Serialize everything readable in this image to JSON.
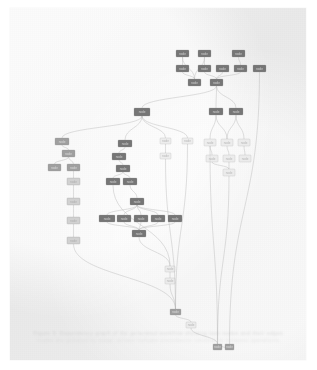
{
  "document": {
    "page_background": "#eeeeee",
    "canvas_background": "#ffffff",
    "caption_primary": "Figure 9: Dependency graph of the generated workflow showing task nodes and their edges.",
    "caption_secondary": "nodes are grouped by stage; arrows indicate precedence constraints between operations."
  },
  "figure": {
    "node_fill_dark": "#6f6f6f",
    "node_fill_mid": "#9a9a9a",
    "node_fill_light": "#cfcfcf",
    "node_fill_faint": "#e2e2e2",
    "node_stroke": "#8a8a8a",
    "edge_color": "#b5b5b5",
    "label_color": "#3a3a3a"
  },
  "chart_data": {
    "type": "diagram",
    "diagram_kind": "directed-acyclic-graph",
    "node_count": 61,
    "edge_count": 74,
    "clusters": [
      {
        "name": "top-right-source-cluster",
        "node_ids": [
          "n1",
          "n2",
          "n3",
          "n4",
          "n5",
          "n6",
          "n7",
          "n8",
          "n9"
        ]
      },
      {
        "name": "left-chain-cluster",
        "node_ids": [
          "n20",
          "n21",
          "n22",
          "n23",
          "n24",
          "n25",
          "n26",
          "n27"
        ]
      },
      {
        "name": "center-stack-cluster",
        "node_ids": [
          "n30",
          "n31",
          "n32",
          "n33",
          "n34"
        ]
      },
      {
        "name": "center-fan-cluster",
        "node_ids": [
          "n35",
          "n36",
          "n37",
          "n38",
          "n39",
          "n40",
          "n41"
        ]
      },
      {
        "name": "right-grid-cluster",
        "node_ids": [
          "n10",
          "n11",
          "n12",
          "n13",
          "n14",
          "n15",
          "n16",
          "n17",
          "n18",
          "n19"
        ]
      },
      {
        "name": "bottom-sink-cluster",
        "node_ids": [
          "n50",
          "n51",
          "n52",
          "n53",
          "n54",
          "n55"
        ]
      }
    ],
    "nodes": [
      {
        "id": "n1",
        "x": 166,
        "y": 42,
        "w": 13,
        "h": 7,
        "shade": "dark",
        "label": "node"
      },
      {
        "id": "n2",
        "x": 188,
        "y": 42,
        "w": 13,
        "h": 7,
        "shade": "dark",
        "label": "node"
      },
      {
        "id": "n3",
        "x": 222,
        "y": 42,
        "w": 13,
        "h": 7,
        "shade": "dark",
        "label": "node"
      },
      {
        "id": "n4",
        "x": 166,
        "y": 57,
        "w": 13,
        "h": 7,
        "shade": "dark",
        "label": "node"
      },
      {
        "id": "n5",
        "x": 188,
        "y": 57,
        "w": 13,
        "h": 7,
        "shade": "dark",
        "label": "node"
      },
      {
        "id": "n6",
        "x": 206,
        "y": 57,
        "w": 13,
        "h": 7,
        "shade": "dark",
        "label": "node"
      },
      {
        "id": "n7",
        "x": 224,
        "y": 57,
        "w": 13,
        "h": 7,
        "shade": "dark",
        "label": "node"
      },
      {
        "id": "n8",
        "x": 243,
        "y": 57,
        "w": 13,
        "h": 7,
        "shade": "dark",
        "label": "node"
      },
      {
        "id": "n9",
        "x": 178,
        "y": 71,
        "w": 13,
        "h": 7,
        "shade": "dark",
        "label": "node"
      },
      {
        "id": "n10",
        "x": 200,
        "y": 71,
        "w": 13,
        "h": 7,
        "shade": "dark",
        "label": "node"
      },
      {
        "id": "n11",
        "x": 199,
        "y": 100,
        "w": 14,
        "h": 7,
        "shade": "dark",
        "label": "node"
      },
      {
        "id": "n12",
        "x": 219,
        "y": 100,
        "w": 14,
        "h": 7,
        "shade": "dark",
        "label": "node"
      },
      {
        "id": "n13",
        "x": 194,
        "y": 131,
        "w": 12,
        "h": 7,
        "shade": "faint",
        "label": "node"
      },
      {
        "id": "n14",
        "x": 211,
        "y": 131,
        "w": 12,
        "h": 7,
        "shade": "faint",
        "label": "node"
      },
      {
        "id": "n15",
        "x": 228,
        "y": 131,
        "w": 12,
        "h": 7,
        "shade": "faint",
        "label": "node"
      },
      {
        "id": "n16",
        "x": 196,
        "y": 147,
        "w": 12,
        "h": 7,
        "shade": "faint",
        "label": "node"
      },
      {
        "id": "n17",
        "x": 213,
        "y": 147,
        "w": 12,
        "h": 7,
        "shade": "faint",
        "label": "node"
      },
      {
        "id": "n18",
        "x": 229,
        "y": 147,
        "w": 12,
        "h": 7,
        "shade": "faint",
        "label": "node"
      },
      {
        "id": "n19",
        "x": 213,
        "y": 161,
        "w": 12,
        "h": 7,
        "shade": "faint",
        "label": "node"
      },
      {
        "id": "n20",
        "x": 45,
        "y": 130,
        "w": 14,
        "h": 7,
        "shade": "mid",
        "label": "node"
      },
      {
        "id": "n21",
        "x": 52,
        "y": 142,
        "w": 13,
        "h": 7,
        "shade": "mid",
        "label": "node"
      },
      {
        "id": "n22",
        "x": 38,
        "y": 156,
        "w": 13,
        "h": 7,
        "shade": "mid",
        "label": "node"
      },
      {
        "id": "n23",
        "x": 57,
        "y": 156,
        "w": 13,
        "h": 7,
        "shade": "mid",
        "label": "node"
      },
      {
        "id": "n24",
        "x": 57,
        "y": 170,
        "w": 13,
        "h": 7,
        "shade": "light",
        "label": "node"
      },
      {
        "id": "n25",
        "x": 57,
        "y": 190,
        "w": 13,
        "h": 7,
        "shade": "light",
        "label": "node"
      },
      {
        "id": "n26",
        "x": 57,
        "y": 209,
        "w": 13,
        "h": 7,
        "shade": "light",
        "label": "node"
      },
      {
        "id": "n27",
        "x": 57,
        "y": 229,
        "w": 13,
        "h": 7,
        "shade": "light",
        "label": "node"
      },
      {
        "id": "n30",
        "x": 124,
        "y": 100,
        "w": 16,
        "h": 8,
        "shade": "dark",
        "label": "node"
      },
      {
        "id": "n31",
        "x": 108,
        "y": 132,
        "w": 14,
        "h": 7,
        "shade": "dark",
        "label": "node"
      },
      {
        "id": "n32",
        "x": 102,
        "y": 145,
        "w": 14,
        "h": 7,
        "shade": "dark",
        "label": "node"
      },
      {
        "id": "n33",
        "x": 106,
        "y": 157,
        "w": 14,
        "h": 7,
        "shade": "dark",
        "label": "node"
      },
      {
        "id": "n34",
        "x": 96,
        "y": 170,
        "w": 14,
        "h": 7,
        "shade": "dark",
        "label": "node"
      },
      {
        "id": "n35",
        "x": 113,
        "y": 170,
        "w": 14,
        "h": 7,
        "shade": "dark",
        "label": "node"
      },
      {
        "id": "n36",
        "x": 120,
        "y": 190,
        "w": 14,
        "h": 7,
        "shade": "dark",
        "label": "node"
      },
      {
        "id": "n37",
        "x": 89,
        "y": 207,
        "w": 16,
        "h": 7,
        "shade": "dark",
        "label": "node"
      },
      {
        "id": "n38",
        "x": 107,
        "y": 207,
        "w": 14,
        "h": 7,
        "shade": "dark",
        "label": "node"
      },
      {
        "id": "n39",
        "x": 124,
        "y": 207,
        "w": 14,
        "h": 7,
        "shade": "dark",
        "label": "node"
      },
      {
        "id": "n40",
        "x": 141,
        "y": 207,
        "w": 14,
        "h": 7,
        "shade": "dark",
        "label": "node"
      },
      {
        "id": "n41",
        "x": 158,
        "y": 207,
        "w": 14,
        "h": 7,
        "shade": "dark",
        "label": "node"
      },
      {
        "id": "n42",
        "x": 122,
        "y": 222,
        "w": 14,
        "h": 7,
        "shade": "dark",
        "label": "node"
      },
      {
        "id": "n43",
        "x": 150,
        "y": 130,
        "w": 11,
        "h": 6,
        "shade": "faint",
        "label": "node"
      },
      {
        "id": "n44",
        "x": 150,
        "y": 145,
        "w": 11,
        "h": 6,
        "shade": "faint",
        "label": "node"
      },
      {
        "id": "n45",
        "x": 172,
        "y": 130,
        "w": 11,
        "h": 6,
        "shade": "faint",
        "label": "node"
      },
      {
        "id": "n50",
        "x": 155,
        "y": 258,
        "w": 10,
        "h": 6,
        "shade": "faint",
        "label": "node"
      },
      {
        "id": "n51",
        "x": 155,
        "y": 270,
        "w": 10,
        "h": 6,
        "shade": "faint",
        "label": "node"
      },
      {
        "id": "n52",
        "x": 160,
        "y": 301,
        "w": 11,
        "h": 6,
        "shade": "mid",
        "label": "node"
      },
      {
        "id": "n53",
        "x": 176,
        "y": 314,
        "w": 10,
        "h": 6,
        "shade": "faint",
        "label": "node"
      },
      {
        "id": "n54",
        "x": 203,
        "y": 336,
        "w": 9,
        "h": 6,
        "shade": "mid",
        "label": "node"
      },
      {
        "id": "n55",
        "x": 215,
        "y": 336,
        "w": 9,
        "h": 6,
        "shade": "mid",
        "label": "node"
      }
    ],
    "edges": [
      [
        "n1",
        "n4"
      ],
      [
        "n2",
        "n5"
      ],
      [
        "n2",
        "n9"
      ],
      [
        "n3",
        "n7"
      ],
      [
        "n1",
        "n9"
      ],
      [
        "n5",
        "n10"
      ],
      [
        "n6",
        "n10"
      ],
      [
        "n7",
        "n10"
      ],
      [
        "n4",
        "n9"
      ],
      [
        "n10",
        "n11"
      ],
      [
        "n10",
        "n12"
      ],
      [
        "n10",
        "n30"
      ],
      [
        "n8",
        "n55"
      ],
      [
        "n11",
        "n13"
      ],
      [
        "n11",
        "n14"
      ],
      [
        "n12",
        "n14"
      ],
      [
        "n12",
        "n15"
      ],
      [
        "n13",
        "n16"
      ],
      [
        "n14",
        "n17"
      ],
      [
        "n15",
        "n18"
      ],
      [
        "n16",
        "n19"
      ],
      [
        "n17",
        "n19"
      ],
      [
        "n30",
        "n20"
      ],
      [
        "n30",
        "n31"
      ],
      [
        "n30",
        "n43"
      ],
      [
        "n30",
        "n45"
      ],
      [
        "n20",
        "n21"
      ],
      [
        "n21",
        "n22"
      ],
      [
        "n21",
        "n23"
      ],
      [
        "n23",
        "n24"
      ],
      [
        "n24",
        "n25"
      ],
      [
        "n25",
        "n26"
      ],
      [
        "n26",
        "n27"
      ],
      [
        "n27",
        "n52"
      ],
      [
        "n31",
        "n32"
      ],
      [
        "n32",
        "n33"
      ],
      [
        "n33",
        "n34"
      ],
      [
        "n33",
        "n35"
      ],
      [
        "n35",
        "n36"
      ],
      [
        "n36",
        "n37"
      ],
      [
        "n36",
        "n38"
      ],
      [
        "n36",
        "n39"
      ],
      [
        "n36",
        "n40"
      ],
      [
        "n36",
        "n41"
      ],
      [
        "n37",
        "n42"
      ],
      [
        "n38",
        "n42"
      ],
      [
        "n39",
        "n42"
      ],
      [
        "n40",
        "n42"
      ],
      [
        "n41",
        "n42"
      ],
      [
        "n34",
        "n50"
      ],
      [
        "n42",
        "n50"
      ],
      [
        "n43",
        "n44"
      ],
      [
        "n44",
        "n52"
      ],
      [
        "n45",
        "n52"
      ],
      [
        "n50",
        "n51"
      ],
      [
        "n51",
        "n52"
      ],
      [
        "n52",
        "n53"
      ],
      [
        "n53",
        "n54"
      ],
      [
        "n13",
        "n54"
      ],
      [
        "n19",
        "n54"
      ],
      [
        "n55",
        "n54"
      ]
    ]
  }
}
